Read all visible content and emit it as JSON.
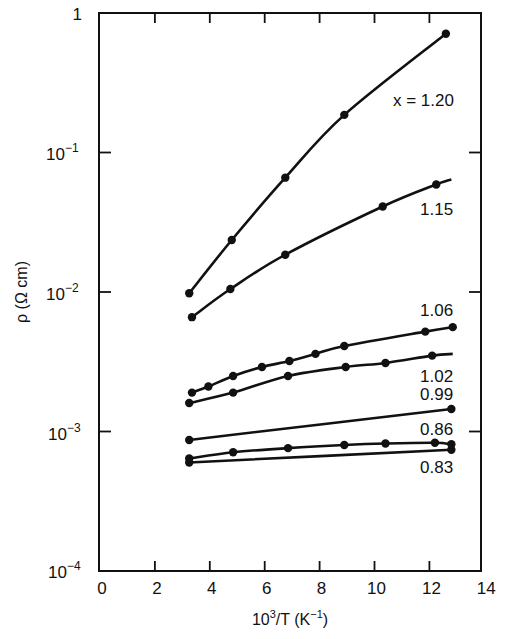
{
  "chart_data": {
    "type": "line",
    "title": "",
    "xlabel": "10^3/T (K^-1)",
    "ylabel": "ρ (Ω cm)",
    "xlim": [
      0,
      14
    ],
    "ylim": [
      0.0001,
      1
    ],
    "yscale": "log",
    "grid": false,
    "legend_position": "inline labels at right of curves",
    "x_ticks": [
      0,
      2,
      4,
      6,
      8,
      10,
      12,
      14
    ],
    "y_ticks": [
      {
        "value": 1,
        "label": "1"
      },
      {
        "value": 0.1,
        "label": "10−1"
      },
      {
        "value": 0.01,
        "label": "10−2"
      },
      {
        "value": 0.001,
        "label": "10−3"
      },
      {
        "value": 0.0001,
        "label": "10−4"
      }
    ],
    "series": [
      {
        "name": "x = 1.20",
        "label": "x = 1.20",
        "label_pos": [
          0,
          0
        ],
        "x": [
          3.25,
          4.8,
          6.75,
          8.9,
          12.6
        ],
        "values": [
          0.0098,
          0.0236,
          0.066,
          0.186,
          0.71
        ]
      },
      {
        "name": "1.15",
        "label": "1.15",
        "x": [
          3.35,
          4.75,
          6.75,
          10.3,
          12.25
        ],
        "values": [
          0.0066,
          0.0105,
          0.0185,
          0.041,
          0.059
        ],
        "line_end": [
          12.8,
          0.064
        ]
      },
      {
        "name": "1.06",
        "label": "1.06",
        "x": [
          3.35,
          3.95,
          4.85,
          5.9,
          6.9,
          7.85,
          8.9,
          11.85,
          12.85
        ],
        "values": [
          0.0019,
          0.0021,
          0.0025,
          0.0029,
          0.0032,
          0.0036,
          0.0041,
          0.0052,
          0.0056
        ]
      },
      {
        "name": "1.02",
        "label": "1.02",
        "x": [
          3.25,
          4.85,
          6.85,
          8.95,
          10.4,
          12.1
        ],
        "values": [
          0.0016,
          0.0019,
          0.0025,
          0.0029,
          0.0031,
          0.0035
        ],
        "line_end": [
          12.85,
          0.0036
        ]
      },
      {
        "name": "0.99",
        "label": "0.99",
        "x": [
          3.25,
          12.8
        ],
        "values": [
          0.00087,
          0.00145
        ],
        "markers_only_at_ends": true
      },
      {
        "name": "0.86",
        "label": "0.86",
        "x": [
          3.25,
          4.85,
          6.85,
          8.9,
          10.4,
          12.2,
          12.8
        ],
        "values": [
          0.00064,
          0.00071,
          0.00076,
          0.0008,
          0.00082,
          0.00083,
          0.00081
        ]
      },
      {
        "name": "0.83",
        "label": "0.83",
        "x": [
          3.25,
          12.8
        ],
        "values": [
          0.0006,
          0.00074
        ]
      }
    ]
  },
  "axis": {
    "x_tick_labels": [
      "0",
      "2",
      "4",
      "6",
      "8",
      "10",
      "12",
      "14"
    ],
    "y_tick_labels": {
      "d0": {
        "base": "1",
        "exp": ""
      },
      "d1": {
        "base": "10",
        "exp": "−1"
      },
      "d2": {
        "base": "10",
        "exp": "−2"
      },
      "d3": {
        "base": "10",
        "exp": "−3"
      },
      "d4": {
        "base": "10",
        "exp": "−4"
      }
    },
    "xlabel": {
      "base": "10",
      "sup": "3",
      "rest": "/T (K",
      "sup2": "−1",
      "close": ")"
    },
    "ylabel": "ρ (Ω cm)"
  },
  "labels": {
    "s120": "x = 1.20",
    "s115": "1.15",
    "s106": "1.06",
    "s102": "1.02",
    "s099": "0.99",
    "s086": "0.86",
    "s083": "0.83"
  }
}
